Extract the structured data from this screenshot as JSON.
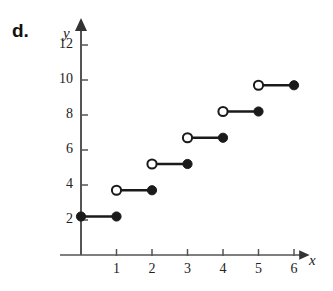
{
  "part_label": "d.",
  "axes": {
    "x_name": "x",
    "y_name": "y"
  },
  "chart_data": {
    "type": "line",
    "title": "",
    "subtitle": "",
    "xlabel": "x",
    "ylabel": "y",
    "xlim": [
      -0.35,
      6.6
    ],
    "ylim": [
      0,
      13.2
    ],
    "xticks": [
      1,
      2,
      3,
      4,
      5,
      6
    ],
    "yticks": [
      2,
      4,
      6,
      8,
      10,
      12
    ],
    "xtick_labels": [
      "1",
      "2",
      "3",
      "4",
      "5",
      "6"
    ],
    "ytick_labels": [
      "2",
      "4",
      "6",
      "8",
      "10",
      "12"
    ],
    "grid": false,
    "legend": null,
    "step_increment": 1.5,
    "segments": [
      {
        "x_start": 0,
        "x_end": 1,
        "y": 2.2,
        "left_endpoint": "closed",
        "right_endpoint": "closed"
      },
      {
        "x_start": 1,
        "x_end": 2,
        "y": 3.7,
        "left_endpoint": "open",
        "right_endpoint": "closed"
      },
      {
        "x_start": 2,
        "x_end": 3,
        "y": 5.2,
        "left_endpoint": "open",
        "right_endpoint": "closed"
      },
      {
        "x_start": 3,
        "x_end": 4,
        "y": 6.7,
        "left_endpoint": "open",
        "right_endpoint": "closed"
      },
      {
        "x_start": 4,
        "x_end": 5,
        "y": 8.2,
        "left_endpoint": "open",
        "right_endpoint": "closed"
      },
      {
        "x_start": 5,
        "x_end": 6,
        "y": 9.7,
        "left_endpoint": "open",
        "right_endpoint": "closed"
      }
    ]
  },
  "colors": {
    "ink": "#1a1a1a",
    "axis": "#555555",
    "background": "#ffffff"
  }
}
